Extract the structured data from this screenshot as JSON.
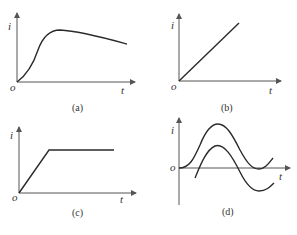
{
  "panels": [
    {
      "id": "a",
      "caption": "(a)",
      "y_label": "i",
      "x_label": "t",
      "origin_label": "o",
      "description": "rises with S-shape to a peak then decays slowly"
    },
    {
      "id": "b",
      "caption": "(b)",
      "y_label": "i",
      "x_label": "t",
      "origin_label": "o",
      "description": "linear ramp from origin"
    },
    {
      "id": "c",
      "caption": "(c)",
      "y_label": "i",
      "x_label": "t",
      "origin_label": "o",
      "description": "linear ramp then constant plateau"
    },
    {
      "id": "d",
      "caption": "(d)",
      "y_label": "i",
      "x_label": "t",
      "origin_label": "o",
      "description": "two phase-shifted sinusoids; one offset above axis, one crossing axis"
    }
  ],
  "colors": {
    "curve": "#2a2a2a",
    "axis": "#555555",
    "background": "#ffffff"
  }
}
